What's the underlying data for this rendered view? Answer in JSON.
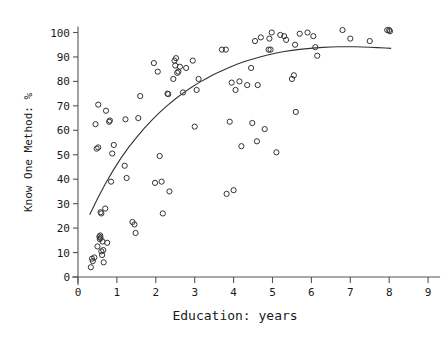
{
  "chart_data": {
    "type": "scatter",
    "title": "",
    "xlabel": "Education: years",
    "ylabel": "Know One Method: %",
    "xlim": [
      0,
      9
    ],
    "ylim": [
      0,
      100
    ],
    "xticks": [
      0,
      1,
      2,
      3,
      4,
      5,
      6,
      7,
      8,
      9
    ],
    "xtick_labels": [
      "0",
      "1",
      "2",
      "3",
      "4",
      "5",
      "6",
      "7",
      "8",
      "9"
    ],
    "yticks": [
      0,
      10,
      20,
      30,
      40,
      50,
      60,
      70,
      80,
      90,
      100
    ],
    "ytick_labels": [
      "0",
      "10",
      "20",
      "30",
      "40",
      "50",
      "60",
      "70",
      "80",
      "90",
      "100"
    ],
    "grid": false,
    "legend": "none",
    "marker": "open-circle",
    "marker_color": "#333333",
    "line_color": "#333333",
    "axis_color": "#555555",
    "background": "#ffffff",
    "points": [
      [
        0.33,
        4.0
      ],
      [
        0.36,
        7.5
      ],
      [
        0.38,
        6.5
      ],
      [
        0.42,
        8.0
      ],
      [
        0.45,
        62.5
      ],
      [
        0.48,
        52.5
      ],
      [
        0.52,
        53.0
      ],
      [
        0.5,
        12.5
      ],
      [
        0.52,
        70.5
      ],
      [
        0.55,
        16.5
      ],
      [
        0.56,
        15.5
      ],
      [
        0.57,
        17.0
      ],
      [
        0.58,
        16.0
      ],
      [
        0.58,
        26.5
      ],
      [
        0.6,
        26.0
      ],
      [
        0.6,
        10.5
      ],
      [
        0.62,
        9.0
      ],
      [
        0.63,
        14.5
      ],
      [
        0.65,
        11.0
      ],
      [
        0.66,
        6.0
      ],
      [
        0.7,
        28.0
      ],
      [
        0.72,
        68.0
      ],
      [
        0.75,
        14.0
      ],
      [
        0.8,
        63.5
      ],
      [
        0.82,
        64.0
      ],
      [
        0.85,
        39.0
      ],
      [
        0.88,
        50.5
      ],
      [
        0.92,
        54.0
      ],
      [
        1.2,
        45.5
      ],
      [
        1.22,
        64.5
      ],
      [
        1.25,
        40.5
      ],
      [
        1.4,
        22.5
      ],
      [
        1.45,
        21.5
      ],
      [
        1.48,
        18.0
      ],
      [
        1.55,
        65.0
      ],
      [
        1.6,
        74.0
      ],
      [
        1.95,
        87.5
      ],
      [
        1.98,
        38.5
      ],
      [
        2.05,
        84.0
      ],
      [
        2.1,
        49.5
      ],
      [
        2.15,
        39.0
      ],
      [
        2.18,
        26.0
      ],
      [
        2.3,
        75.0
      ],
      [
        2.32,
        74.8
      ],
      [
        2.35,
        35.0
      ],
      [
        2.45,
        81.0
      ],
      [
        2.48,
        88.5
      ],
      [
        2.5,
        86.5
      ],
      [
        2.52,
        89.5
      ],
      [
        2.55,
        83.5
      ],
      [
        2.58,
        84.0
      ],
      [
        2.62,
        86.0
      ],
      [
        2.7,
        75.5
      ],
      [
        2.78,
        85.5
      ],
      [
        2.95,
        88.5
      ],
      [
        3.0,
        61.5
      ],
      [
        3.05,
        76.5
      ],
      [
        3.1,
        81.0
      ],
      [
        3.7,
        93.0
      ],
      [
        3.8,
        93.0
      ],
      [
        3.82,
        34.0
      ],
      [
        3.9,
        63.5
      ],
      [
        3.95,
        79.5
      ],
      [
        4.0,
        35.5
      ],
      [
        4.05,
        76.5
      ],
      [
        4.15,
        80.0
      ],
      [
        4.2,
        53.5
      ],
      [
        4.35,
        78.5
      ],
      [
        4.45,
        85.5
      ],
      [
        4.48,
        63.0
      ],
      [
        4.55,
        96.5
      ],
      [
        4.6,
        55.5
      ],
      [
        4.62,
        78.5
      ],
      [
        4.7,
        98.0
      ],
      [
        4.8,
        60.5
      ],
      [
        4.9,
        93.0
      ],
      [
        4.92,
        97.5
      ],
      [
        4.95,
        93.0
      ],
      [
        4.98,
        100.0
      ],
      [
        5.1,
        51.0
      ],
      [
        5.2,
        99.0
      ],
      [
        5.3,
        98.5
      ],
      [
        5.35,
        97.0
      ],
      [
        5.5,
        81.0
      ],
      [
        5.55,
        82.5
      ],
      [
        5.58,
        95.0
      ],
      [
        5.6,
        67.5
      ],
      [
        5.7,
        99.5
      ],
      [
        5.9,
        100.0
      ],
      [
        6.05,
        98.5
      ],
      [
        6.1,
        94.0
      ],
      [
        6.15,
        90.5
      ],
      [
        6.8,
        101.0
      ],
      [
        7.0,
        97.5
      ],
      [
        7.5,
        96.5
      ],
      [
        7.95,
        101.0
      ],
      [
        8.0,
        101.0
      ],
      [
        8.02,
        100.5
      ]
    ],
    "fit_curve": {
      "description": "smoothed logistic-like trend line",
      "points": [
        [
          0.3,
          25.5
        ],
        [
          0.5,
          32.0
        ],
        [
          0.7,
          38.0
        ],
        [
          0.9,
          43.5
        ],
        [
          1.1,
          48.5
        ],
        [
          1.3,
          53.0
        ],
        [
          1.5,
          57.0
        ],
        [
          1.7,
          60.8
        ],
        [
          1.9,
          64.2
        ],
        [
          2.1,
          67.3
        ],
        [
          2.3,
          70.2
        ],
        [
          2.5,
          72.8
        ],
        [
          2.7,
          75.2
        ],
        [
          2.9,
          77.4
        ],
        [
          3.1,
          79.4
        ],
        [
          3.3,
          81.2
        ],
        [
          3.5,
          82.9
        ],
        [
          3.7,
          84.4
        ],
        [
          3.9,
          85.8
        ],
        [
          4.1,
          87.1
        ],
        [
          4.3,
          88.2
        ],
        [
          4.5,
          89.2
        ],
        [
          4.7,
          90.1
        ],
        [
          4.9,
          90.9
        ],
        [
          5.1,
          91.6
        ],
        [
          5.3,
          92.2
        ],
        [
          5.5,
          92.7
        ],
        [
          5.7,
          93.1
        ],
        [
          5.9,
          93.4
        ],
        [
          6.1,
          93.7
        ],
        [
          6.3,
          93.9
        ],
        [
          6.5,
          94.05
        ],
        [
          6.7,
          94.15
        ],
        [
          6.9,
          94.2
        ],
        [
          7.1,
          94.18
        ],
        [
          7.3,
          94.1
        ],
        [
          7.5,
          93.98
        ],
        [
          7.7,
          93.82
        ],
        [
          7.9,
          93.65
        ],
        [
          8.05,
          93.5
        ]
      ]
    }
  }
}
